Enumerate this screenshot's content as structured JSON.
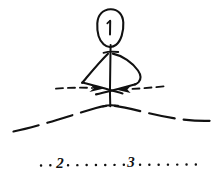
{
  "figure": {
    "background_color": "#ffffff",
    "ink_color": "#111111",
    "width": 222,
    "height": 177,
    "style": "hand-drawn ink line sketch"
  },
  "labels": {
    "callout_1": "1",
    "callout_2": "2",
    "callout_3": "3"
  },
  "elements": {
    "oval": {
      "name": "ellipse-callout",
      "label": "1",
      "center_x": 110,
      "center_y": 28,
      "radius_x": 13,
      "radius_y": 19
    },
    "canopy": {
      "name": "dome-canopy",
      "description": "bell / canopy outline with straight left edge and bulging right edge",
      "apex_x": 110,
      "apex_y": 52,
      "base_left_x": 82,
      "base_right_x": 140,
      "base_y": 84
    },
    "axis": {
      "name": "vertical-axis-line",
      "x": 110,
      "y_top": 45,
      "y_bottom": 106
    },
    "arrow_left": {
      "name": "left-convergent-arrow",
      "direction": "right",
      "dashed": true,
      "start_x": 56,
      "end_x": 104,
      "y": 88
    },
    "arrow_right": {
      "name": "right-convergent-arrow",
      "direction": "left",
      "dashed": true,
      "start_x": 163,
      "end_x": 116,
      "y": 88
    },
    "ground_arc": {
      "name": "dashed-ground-arc",
      "dashed": true,
      "left_x": 14,
      "left_y": 130,
      "peak_x": 110,
      "peak_y": 106,
      "right_x": 210,
      "right_y": 120
    },
    "dotted_baseline": {
      "name": "dotted-reference-line",
      "y": 165,
      "start_x": 40,
      "end_x": 196,
      "dot_labels": [
        "2",
        "3"
      ],
      "label_2_x": 60,
      "label_3_x": 131
    }
  }
}
